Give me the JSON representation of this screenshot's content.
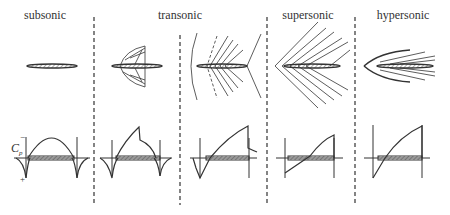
{
  "regimes": [
    {
      "label": "subsonic",
      "x": 45
    },
    {
      "label": "transonic",
      "x": 180
    },
    {
      "label": "supersonic",
      "x": 305
    },
    {
      "label": "hypersonic",
      "x": 405
    }
  ],
  "axis": {
    "cp_label": "C",
    "cp_sub": "p",
    "minus": "−",
    "plus": "+"
  },
  "colors": {
    "line": "#333333",
    "hatch": "#666666"
  }
}
